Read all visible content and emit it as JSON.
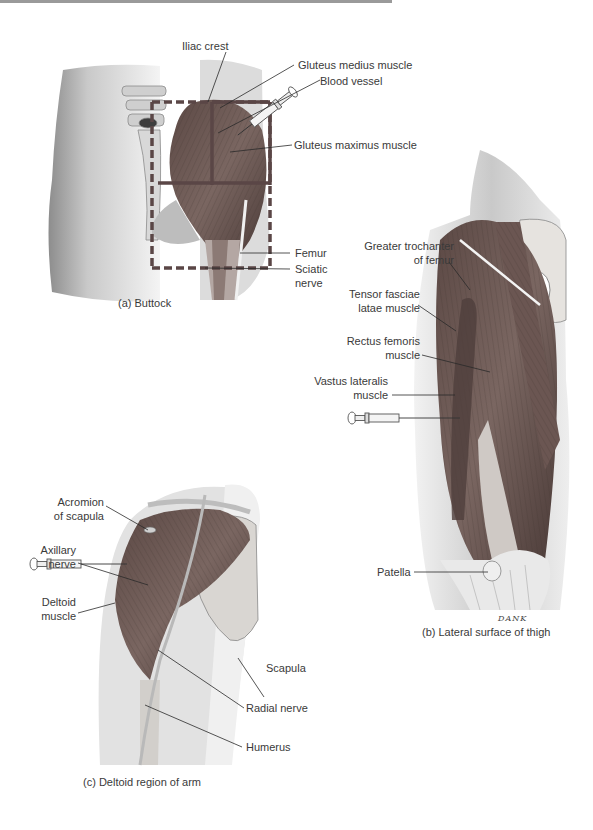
{
  "figure": {
    "panels": [
      {
        "id": "a",
        "caption": "(a) Buttock",
        "labels": {
          "iliac_crest": "Iliac crest",
          "gluteus_medius": "Gluteus medius muscle",
          "blood_vessel": "Blood vessel",
          "gluteus_maximus": "Gluteus maximus muscle",
          "femur": "Femur",
          "sciatic_nerve_1": "Sciatic",
          "sciatic_nerve_2": "nerve"
        }
      },
      {
        "id": "b",
        "caption": "(b) Lateral surface of thigh",
        "signature": "DANK",
        "labels": {
          "greater_trochanter_1": "Greater trochanter",
          "greater_trochanter_2": "of femur",
          "tensor_fasciae_1": "Tensor fasciae",
          "tensor_fasciae_2": "latae muscle",
          "rectus_femoris_1": "Rectus femoris",
          "rectus_femoris_2": "muscle",
          "vastus_lateralis_1": "Vastus lateralis",
          "vastus_lateralis_2": "muscle",
          "patella": "Patella"
        }
      },
      {
        "id": "c",
        "caption": "(c) Deltoid region of arm",
        "labels": {
          "acromion_1": "Acromion",
          "acromion_2": "of scapula",
          "axillary_1": "Axillary",
          "axillary_2": "nerve",
          "deltoid_1": "Deltoid",
          "deltoid_2": "muscle",
          "scapula": "Scapula",
          "radial_nerve": "Radial nerve",
          "humerus": "Humerus"
        }
      }
    ],
    "colors": {
      "muscle": "#6e5a56",
      "muscle_dark": "#4f3f3c",
      "skin": "#d8d8d8",
      "bone": "#e8e6e2",
      "quadrant_line": "#5a4646",
      "leader": "#2a2a2a"
    }
  }
}
